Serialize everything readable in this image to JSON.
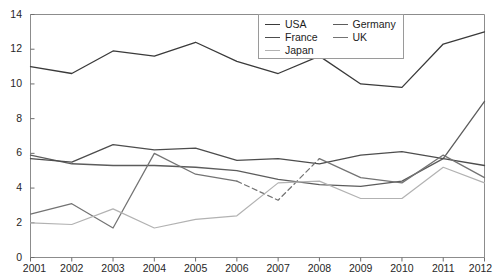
{
  "title_remnant": "· · ·",
  "legend": {
    "position": "top-right",
    "columns": [
      [
        {
          "label": "USA",
          "color": "#3a3a3a",
          "dash": "none"
        },
        {
          "label": "France",
          "color": "#4d4d4d",
          "dash": "none"
        },
        {
          "label": "Japan",
          "color": "#b2b2b2",
          "dash": "none"
        }
      ],
      [
        {
          "label": "Germany",
          "color": "#5c5c5c",
          "dash": "none"
        },
        {
          "label": "UK",
          "color": "#737373",
          "dash": "none"
        }
      ]
    ]
  },
  "axes": {
    "y_ticks": [
      "0",
      "2",
      "4",
      "6",
      "8",
      "10",
      "12",
      "14"
    ],
    "x_ticks": [
      "2001",
      "2002",
      "2003",
      "2004",
      "2005",
      "2006",
      "2007",
      "2008",
      "2009",
      "2010",
      "2011",
      "2012"
    ]
  },
  "chart_data": {
    "type": "line",
    "title": "",
    "xlabel": "",
    "ylabel": "",
    "xlim": [
      2001,
      2012
    ],
    "ylim": [
      0,
      14
    ],
    "y_tick_step": 2,
    "grid": false,
    "legend_position": "top-right",
    "x": [
      2001,
      2002,
      2003,
      2004,
      2005,
      2006,
      2007,
      2008,
      2009,
      2010,
      2011,
      2012
    ],
    "categories": [
      "2001",
      "2002",
      "2003",
      "2004",
      "2005",
      "2006",
      "2007",
      "2008",
      "2009",
      "2010",
      "2011",
      "2012"
    ],
    "series": [
      {
        "name": "USA",
        "color": "#3a3a3a",
        "values": [
          11.0,
          10.6,
          11.9,
          11.6,
          12.4,
          11.3,
          10.6,
          11.6,
          10.0,
          9.8,
          12.3,
          13.0
        ]
      },
      {
        "name": "Germany",
        "color": "#5c5c5c",
        "values": [
          5.9,
          5.4,
          5.3,
          5.3,
          5.2,
          5.0,
          4.5,
          4.2,
          4.1,
          4.4,
          5.7,
          9.0
        ]
      },
      {
        "name": "France",
        "color": "#4d4d4d",
        "values": [
          5.7,
          5.5,
          6.5,
          6.2,
          6.3,
          5.6,
          5.7,
          5.4,
          5.9,
          6.1,
          5.7,
          5.3
        ]
      },
      {
        "name": "UK",
        "color": "#737373",
        "values": [
          2.5,
          3.1,
          1.7,
          6.0,
          4.8,
          4.4,
          3.3,
          5.7,
          4.6,
          4.3,
          5.9,
          4.6
        ],
        "dash_segment_note": "dashed between 2006 and 2008"
      },
      {
        "name": "Japan",
        "color": "#b2b2b2",
        "values": [
          2.0,
          1.9,
          2.8,
          1.7,
          2.2,
          2.4,
          4.3,
          4.4,
          3.4,
          3.4,
          5.2,
          4.3
        ]
      }
    ]
  }
}
